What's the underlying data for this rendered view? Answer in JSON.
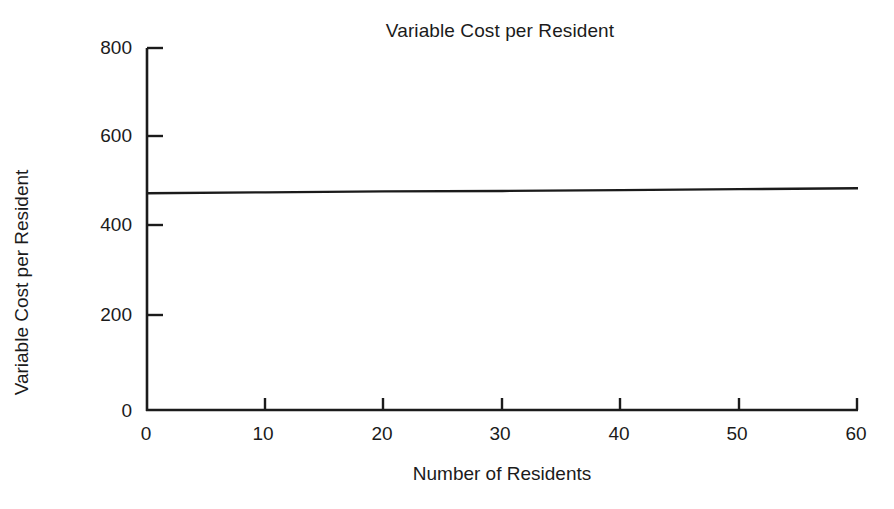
{
  "chart_data": {
    "type": "line",
    "title": "Variable Cost per Resident",
    "xlabel": "Number of Residents",
    "ylabel": "Variable Cost per Resident",
    "xlim": [
      0,
      60
    ],
    "ylim": [
      0,
      800
    ],
    "xticks": [
      0,
      10,
      20,
      30,
      40,
      50,
      60
    ],
    "xtick_labels": [
      "0",
      "10",
      "20",
      "30",
      "40",
      "50",
      "60"
    ],
    "yticks": [
      0,
      200,
      400,
      600,
      800
    ],
    "ytick_labels": [
      "0",
      "200",
      "400",
      "600",
      "800"
    ],
    "grid": false,
    "legend": null,
    "line_color": "#1b1b1b",
    "axis_color": "#1b1b1b",
    "background": "#ffffff",
    "series": [
      {
        "name": "Variable Cost per Resident",
        "x": [
          0,
          10,
          20,
          30,
          40,
          50,
          60
        ],
        "values": [
          479,
          481,
          483,
          484,
          486,
          488,
          490
        ]
      }
    ],
    "annotations": []
  },
  "axis_labels": {
    "y_ticks": [
      {
        "value": "800"
      },
      {
        "value": "600"
      },
      {
        "value": "400"
      },
      {
        "value": "200"
      },
      {
        "value": "0"
      }
    ],
    "x_ticks": [
      {
        "value": "0"
      },
      {
        "value": "10"
      },
      {
        "value": "20"
      },
      {
        "value": "30"
      },
      {
        "value": "40"
      },
      {
        "value": "50"
      },
      {
        "value": "60"
      }
    ]
  }
}
